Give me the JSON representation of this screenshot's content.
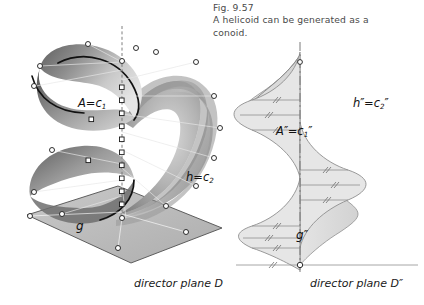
{
  "figure": {
    "number": "Fig. 9.57",
    "caption_line1": "A helicoid can be generated as a",
    "caption_line2": "conoid."
  },
  "left_view": {
    "name": "3D perspective view of helicoid",
    "labels": {
      "axis_point": "A=c",
      "axis_point_sub": "1",
      "helix": "h=c",
      "helix_sub": "2",
      "generator": "g",
      "director_plane": "director plane D"
    }
  },
  "right_view": {
    "name": "front view of helicoid",
    "labels": {
      "axis_point": "A",
      "axis_point_prime": "″",
      "axis_point_eq": "=c",
      "axis_point_sub": "1",
      "axis_point_sub_prime": "″",
      "helix": "h",
      "helix_prime": "″",
      "helix_eq": "=c",
      "helix_sub": "2",
      "helix_sub_prime": "″",
      "generator": "g",
      "generator_prime": "″",
      "director_plane": "director plane D″"
    }
  },
  "colors": {
    "surface_light": "#f2f2f2",
    "surface_mid": "#b9b9b9",
    "surface_dark": "#6e6e6e",
    "outline": "#8a8a8a",
    "plane_fill": "#b6b6b6",
    "plane_edge": "#4b4b4b",
    "marker_fill": "#ffffff",
    "marker_edge": "#1a1a1a",
    "caption_text": "#4a4a4a",
    "label_text": "#111111",
    "axis_line": "#7a7a7a"
  }
}
